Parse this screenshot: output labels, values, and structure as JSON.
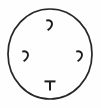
{
  "figure": {
    "title": "Circle with four interior marks",
    "background_color": "#fefefe",
    "stroke_color": "#262626",
    "width": 101,
    "height": 108,
    "caption": ""
  },
  "circle": {
    "name": "outer-circle",
    "center_x": 50,
    "center_y": 54,
    "radius_x": 42,
    "radius_y": 45,
    "stroke_width": 1.7,
    "fill": "none"
  },
  "marks": [
    {
      "id": "mark-top",
      "position": "top",
      "glyph": "comma",
      "label": "’",
      "center_x": 49,
      "center_y": 25
    },
    {
      "id": "mark-left",
      "position": "left",
      "glyph": "comma",
      "label": "’",
      "center_x": 25,
      "center_y": 56
    },
    {
      "id": "mark-right",
      "position": "right",
      "glyph": "comma",
      "label": "’",
      "center_x": 79,
      "center_y": 56
    },
    {
      "id": "mark-bottom",
      "position": "bottom",
      "glyph": "tack",
      "label": "⊤",
      "center_x": 50,
      "center_y": 86
    }
  ],
  "counts": {
    "total_marks": 4,
    "comma_marks": 3,
    "tack_marks": 1
  }
}
